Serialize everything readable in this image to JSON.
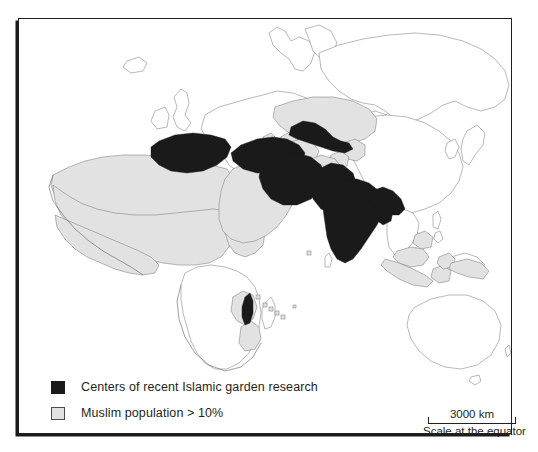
{
  "figure": {
    "type": "thematic-world-map",
    "frame_border_color": "#231f20",
    "background_color": "#ffffff"
  },
  "map": {
    "projection_note": "world map, Europe-Africa-Asia-Australia extent",
    "colors": {
      "highlight_fill": "#1a1a1a",
      "shaded_fill": "#e2e2e2",
      "unshaded_fill": "#ffffff",
      "outline": "#808080",
      "coast_outline": "#595959"
    },
    "highlight_regions": [
      "Spain",
      "Turkey",
      "Iran",
      "Uzbekistan",
      "Pakistan",
      "India",
      "Bangladesh",
      "Malawi"
    ],
    "shaded_regions": [
      "Morocco",
      "Algeria",
      "Tunisia",
      "Libya",
      "Egypt",
      "Mauritania",
      "Mali",
      "Niger",
      "Chad",
      "Sudan",
      "Senegal",
      "Gambia",
      "Guinea",
      "Sierra Leone",
      "Burkina Faso",
      "Nigeria",
      "Somalia",
      "Djibouti",
      "Eritrea",
      "Ethiopia",
      "Bosnia and Herzegovina",
      "Albania",
      "Saudi Arabia",
      "Yemen",
      "Oman",
      "United Arab Emirates",
      "Qatar",
      "Kuwait",
      "Iraq",
      "Syria",
      "Jordan",
      "Lebanon",
      "Azerbaijan",
      "Kazakhstan",
      "Turkmenistan",
      "Kyrgyzstan",
      "Tajikistan",
      "Afghanistan",
      "Indonesia",
      "Malaysia",
      "Brunei",
      "Comoros",
      "Mayotte",
      "Maldives",
      "Tanzania",
      "Mozambique"
    ]
  },
  "legend": {
    "items": [
      {
        "swatch": "black",
        "label": "Centers of recent Islamic garden research"
      },
      {
        "swatch": "gray",
        "label": "Muslim population > 10%"
      }
    ]
  },
  "scalebar": {
    "value": "3000 km",
    "caption": "Scale at the equator"
  }
}
